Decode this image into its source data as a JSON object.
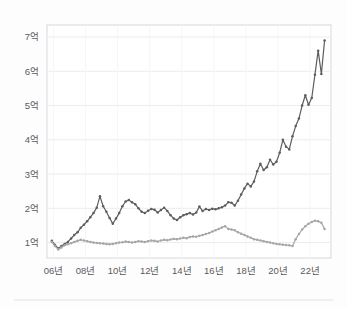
{
  "chart_data": {
    "type": "line",
    "title": "",
    "subtitle": "",
    "xlabel": "",
    "ylabel": "",
    "xlim": [
      2005.6,
      2023.3
    ],
    "ylim": [
      0.55,
      7.35
    ],
    "grid": true,
    "legend": "none",
    "unit_suffix": "억",
    "y_ticks": [
      1,
      2,
      3,
      4,
      5,
      6,
      7
    ],
    "y_tick_labels": [
      "1억",
      "2억",
      "3억",
      "4억",
      "5억",
      "6억",
      "7억"
    ],
    "x_ticks": [
      2006,
      2008,
      2010,
      2012,
      2014,
      2016,
      2018,
      2020,
      2022
    ],
    "x_tick_labels": [
      "06년",
      "08년",
      "10년",
      "12년",
      "14년",
      "16년",
      "18년",
      "20년",
      "22년"
    ],
    "colors": {
      "series_upper": "#5d5d5d",
      "series_lower": "#a6a6a6",
      "grid": "#ececec",
      "frame": "#d8d8d8",
      "tick_text": "#5a5a5a",
      "background": "#fdfdfd",
      "plot_background": "#ffffff"
    },
    "series": [
      {
        "name": "upper-series",
        "color": "#5d5d5d",
        "marker": "dot",
        "x": [
          2005.9,
          2006.1,
          2006.3,
          2006.5,
          2006.7,
          2006.9,
          2007.1,
          2007.3,
          2007.5,
          2007.7,
          2007.9,
          2008.1,
          2008.3,
          2008.5,
          2008.7,
          2008.9,
          2009.1,
          2009.3,
          2009.5,
          2009.7,
          2009.9,
          2010.1,
          2010.3,
          2010.5,
          2010.7,
          2010.9,
          2011.1,
          2011.3,
          2011.5,
          2011.7,
          2011.9,
          2012.1,
          2012.3,
          2012.5,
          2012.7,
          2012.9,
          2013.1,
          2013.3,
          2013.5,
          2013.7,
          2013.9,
          2014.1,
          2014.3,
          2014.5,
          2014.7,
          2014.9,
          2015.1,
          2015.3,
          2015.5,
          2015.7,
          2015.9,
          2016.1,
          2016.3,
          2016.5,
          2016.7,
          2016.9,
          2017.1,
          2017.3,
          2017.5,
          2017.7,
          2017.9,
          2018.1,
          2018.3,
          2018.5,
          2018.7,
          2018.9,
          2019.1,
          2019.3,
          2019.5,
          2019.7,
          2019.9,
          2020.1,
          2020.3,
          2020.5,
          2020.7,
          2020.9,
          2021.1,
          2021.3,
          2021.5,
          2021.7,
          2021.9,
          2022.1,
          2022.3,
          2022.5,
          2022.7,
          2022.9
        ],
        "y": [
          1.05,
          0.93,
          0.83,
          0.9,
          0.96,
          1.02,
          1.12,
          1.22,
          1.3,
          1.43,
          1.52,
          1.62,
          1.74,
          1.86,
          2.02,
          2.35,
          2.06,
          1.9,
          1.72,
          1.55,
          1.7,
          1.86,
          2.06,
          2.2,
          2.24,
          2.18,
          2.12,
          2.0,
          1.9,
          1.86,
          1.93,
          1.98,
          1.96,
          1.88,
          1.95,
          2.02,
          1.92,
          1.8,
          1.7,
          1.66,
          1.74,
          1.8,
          1.83,
          1.86,
          1.82,
          1.88,
          2.05,
          1.92,
          1.98,
          1.95,
          1.99,
          1.97,
          2.0,
          2.03,
          2.08,
          2.18,
          2.16,
          2.08,
          2.22,
          2.4,
          2.58,
          2.72,
          2.64,
          2.78,
          3.08,
          3.3,
          3.12,
          3.2,
          3.42,
          3.28,
          3.36,
          3.62,
          4.0,
          3.8,
          3.72,
          4.1,
          4.4,
          4.62,
          5.0,
          5.3,
          5.02,
          5.22,
          5.9,
          6.6,
          5.92,
          6.9
        ]
      },
      {
        "name": "lower-series",
        "color": "#a6a6a6",
        "marker": "dot",
        "x": [
          2005.9,
          2006.1,
          2006.3,
          2006.5,
          2006.7,
          2006.9,
          2007.1,
          2007.3,
          2007.5,
          2007.7,
          2007.9,
          2008.1,
          2008.3,
          2008.5,
          2008.7,
          2008.9,
          2009.1,
          2009.3,
          2009.5,
          2009.7,
          2009.9,
          2010.1,
          2010.3,
          2010.5,
          2010.7,
          2010.9,
          2011.1,
          2011.3,
          2011.5,
          2011.7,
          2011.9,
          2012.1,
          2012.3,
          2012.5,
          2012.7,
          2012.9,
          2013.1,
          2013.3,
          2013.5,
          2013.7,
          2013.9,
          2014.1,
          2014.3,
          2014.5,
          2014.7,
          2014.9,
          2015.1,
          2015.3,
          2015.5,
          2015.7,
          2015.9,
          2016.1,
          2016.3,
          2016.5,
          2016.7,
          2016.9,
          2017.1,
          2017.3,
          2017.5,
          2017.7,
          2017.9,
          2018.1,
          2018.3,
          2018.5,
          2018.7,
          2018.9,
          2019.1,
          2019.3,
          2019.5,
          2019.7,
          2019.9,
          2020.1,
          2020.3,
          2020.5,
          2020.7,
          2020.9,
          2021.1,
          2021.3,
          2021.5,
          2021.7,
          2021.9,
          2022.1,
          2022.3,
          2022.5,
          2022.7,
          2022.9
        ],
        "y": [
          1.02,
          0.9,
          0.8,
          0.86,
          0.92,
          0.95,
          0.98,
          1.02,
          1.05,
          1.08,
          1.06,
          1.04,
          1.02,
          1.0,
          0.99,
          0.98,
          0.97,
          0.96,
          0.95,
          0.96,
          0.98,
          1.0,
          1.01,
          1.03,
          1.02,
          1.0,
          1.02,
          1.04,
          1.03,
          1.02,
          1.04,
          1.06,
          1.05,
          1.03,
          1.06,
          1.08,
          1.07,
          1.09,
          1.11,
          1.1,
          1.12,
          1.14,
          1.13,
          1.16,
          1.18,
          1.17,
          1.2,
          1.22,
          1.25,
          1.28,
          1.32,
          1.36,
          1.4,
          1.44,
          1.48,
          1.4,
          1.38,
          1.36,
          1.3,
          1.26,
          1.22,
          1.18,
          1.14,
          1.1,
          1.08,
          1.06,
          1.04,
          1.02,
          1.0,
          0.98,
          0.96,
          0.95,
          0.94,
          0.93,
          0.92,
          0.9,
          1.1,
          1.25,
          1.38,
          1.48,
          1.55,
          1.6,
          1.64,
          1.62,
          1.58,
          1.4
        ]
      }
    ]
  },
  "layout": {
    "plot_left": 47,
    "plot_right": 331,
    "plot_top": 25,
    "plot_bottom": 258,
    "width": 347,
    "height": 309
  }
}
